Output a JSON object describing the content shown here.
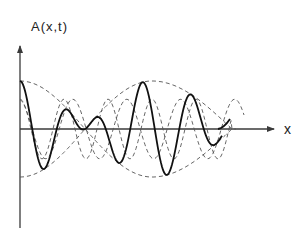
{
  "diagram": {
    "title": "",
    "y_axis_label": "A(x,t)",
    "x_axis_label": "x",
    "colors": {
      "axis": "#3a3a3a",
      "solid_wave": "#111111",
      "dashed_wave": "#555555"
    },
    "curves": [
      {
        "name": "envelope",
        "style": "dashed"
      },
      {
        "name": "component-wave-1",
        "style": "dashed"
      },
      {
        "name": "component-wave-2",
        "style": "dashed"
      },
      {
        "name": "resultant-wave",
        "style": "solid"
      }
    ]
  }
}
